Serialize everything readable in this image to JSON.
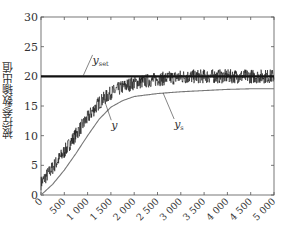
{
  "chart_data": {
    "type": "line",
    "title": "",
    "xlabel": "",
    "ylabel": "被控参数输出值",
    "xlim": [
      0,
      5000
    ],
    "ylim": [
      0,
      30
    ],
    "xticks": [
      0,
      500,
      1000,
      1500,
      2000,
      2500,
      3000,
      3500,
      4000,
      4500,
      5000
    ],
    "xtick_labels": [
      "0",
      "500",
      "1 000",
      "1 500",
      "2 000",
      "2 500",
      "3 000",
      "3 500",
      "4 000",
      "4 500",
      "5 000"
    ],
    "yticks": [
      0,
      5,
      10,
      15,
      20,
      25,
      30
    ],
    "ytick_labels": [
      "0",
      "5",
      "10",
      "15",
      "20",
      "25",
      "30"
    ],
    "grid": false,
    "legend": "none (inline annotations)",
    "series": [
      {
        "name": "y_set",
        "style": "thick black horizontal line",
        "x": [
          0,
          5000
        ],
        "values": [
          20,
          20
        ]
      },
      {
        "name": "y",
        "style": "black noisy line",
        "noise_amplitude": 1.2,
        "x": [
          0,
          250,
          500,
          750,
          1000,
          1250,
          1500,
          1750,
          2000,
          2500,
          3000,
          3500,
          4000,
          4500,
          5000
        ],
        "values": [
          2.0,
          4.6,
          7.3,
          10.2,
          13.0,
          15.6,
          17.2,
          18.2,
          18.9,
          19.5,
          19.9,
          20.0,
          20.0,
          20.0,
          20.0
        ]
      },
      {
        "name": "y_s",
        "style": "thin grey line",
        "x": [
          0,
          250,
          500,
          750,
          1000,
          1250,
          1500,
          1750,
          2000,
          2500,
          3000,
          3500,
          4000,
          4500,
          5000
        ],
        "values": [
          0.0,
          1.8,
          4.2,
          7.0,
          10.0,
          12.8,
          14.8,
          15.9,
          16.6,
          17.1,
          17.4,
          17.6,
          17.8,
          17.9,
          17.9
        ]
      }
    ],
    "annotations": [
      {
        "text": "y",
        "sub": "set",
        "target": "y_set",
        "label_x": 1150,
        "label_y": 22.6,
        "point_x": 900,
        "point_y": 20
      },
      {
        "text": "y",
        "sub": "",
        "target": "y",
        "label_x": 1550,
        "label_y": 11.6,
        "point_x": 1350,
        "point_y": 16.2
      },
      {
        "text": "y",
        "sub": "s",
        "target": "y_s",
        "label_x": 2900,
        "label_y": 11.8,
        "point_x": 2620,
        "point_y": 17.2
      }
    ]
  },
  "colors": {
    "axis": "#555555",
    "y_set": "#111111",
    "y": "#1a1a1a",
    "y_s": "#777777",
    "text": "#333333"
  }
}
